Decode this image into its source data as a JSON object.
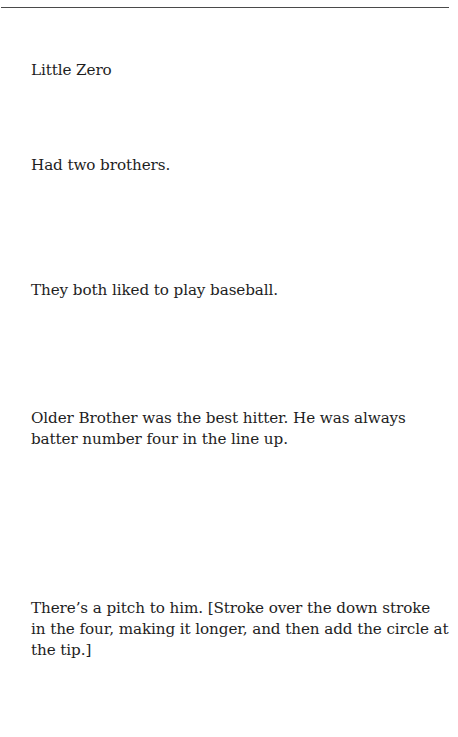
{
  "document": {
    "paragraphs": [
      "Little Zero",
      "Had two brothers.",
      "They both liked to play baseball.",
      "Older Brother was the best hitter. He was always batter number four in the line up.",
      "There’s a pitch to him. [Stroke over the down stroke in the four, making it longer, and then add the circle at the tip.]"
    ]
  }
}
